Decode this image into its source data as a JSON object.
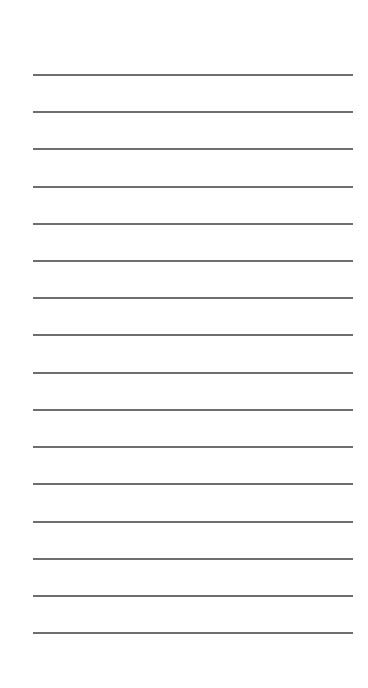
{
  "paper": {
    "background": "#ffffff",
    "line_color": "#6e6e6e",
    "line_count": 16,
    "lines_y": [
      74,
      111,
      148,
      186,
      223,
      260,
      297,
      334,
      372,
      409,
      446,
      483,
      521,
      558,
      595,
      632
    ]
  }
}
